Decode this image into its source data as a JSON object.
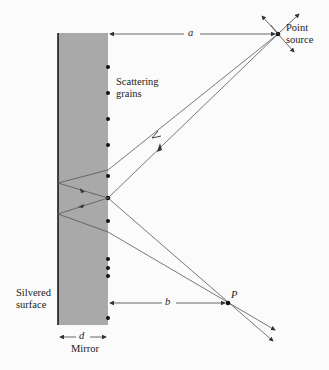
{
  "labels": {
    "point_source_1": "Point",
    "point_source_2": "source",
    "scattering_1": "Scattering",
    "scattering_2": "grains",
    "silvered_1": "Silvered",
    "silvered_2": "surface",
    "mirror": "Mirror",
    "a": "a",
    "b": "b",
    "d": "d",
    "P": "P"
  },
  "colors": {
    "mirror_fill": "#a9a9a9",
    "line": "#555555",
    "background": "#fbfbfb"
  }
}
